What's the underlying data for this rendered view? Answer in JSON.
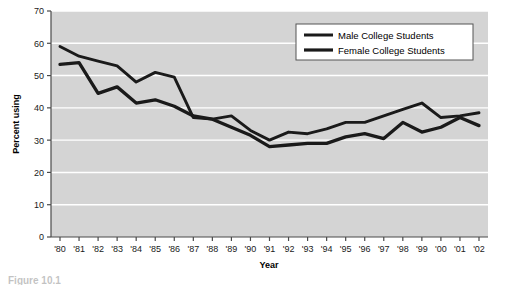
{
  "chart_data": {
    "type": "line",
    "title": "",
    "xlabel": "Year",
    "ylabel": "Percent using",
    "ylim": [
      0,
      70
    ],
    "ytick_step": 10,
    "grid": "horizontal",
    "legend_position": "top-right",
    "plot_background": "#d4d4d4",
    "line_color": "#1a1a1a",
    "categories": [
      "'80",
      "'81",
      "'82",
      "'83",
      "'84",
      "'85",
      "'86",
      "'87",
      "'88",
      "'89",
      "'90",
      "'91",
      "'92",
      "'93",
      "'94",
      "'95",
      "'96",
      "'97",
      "'98",
      "'99",
      "'00",
      "'01",
      "'02"
    ],
    "yticks": [
      "0",
      "10",
      "20",
      "30",
      "40",
      "50",
      "60",
      "70"
    ],
    "series": [
      {
        "name": "Male College Students",
        "values": [
          59.0,
          56.0,
          54.5,
          53.0,
          48.0,
          51.0,
          49.5,
          37.0,
          36.5,
          37.5,
          33.0,
          30.0,
          32.5,
          32.0,
          33.5,
          35.5,
          35.5,
          37.5,
          39.5,
          41.5,
          37.0,
          37.5,
          38.5
        ]
      },
      {
        "name": "Female College Students",
        "values": [
          53.5,
          54.0,
          44.5,
          46.5,
          41.5,
          42.5,
          40.5,
          37.5,
          36.5,
          34.0,
          31.5,
          28.0,
          28.5,
          29.0,
          29.0,
          31.0,
          32.0,
          30.5,
          35.5,
          32.5,
          34.0,
          37.0,
          34.5
        ]
      }
    ]
  },
  "legend": {
    "entries": [
      {
        "label": "Male College Students"
      },
      {
        "label": "Female College Students"
      }
    ]
  },
  "caption": {
    "text": "Figure 10.1"
  }
}
